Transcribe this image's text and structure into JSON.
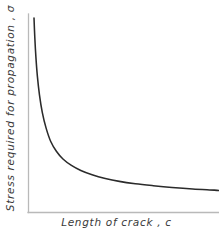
{
  "figure": {
    "background_color": "#ffffff",
    "axis_color": "#b9b9b9",
    "curve_color": "#2b2b2b",
    "text_color": "#3a3a3a"
  },
  "axes": {
    "x_label": "Length  of  crack , c",
    "y_label": "Stress  required  for  propagation , σ"
  },
  "chart_data": {
    "type": "line",
    "title": "",
    "xlabel": "Length  of  crack , c",
    "ylabel": "Stress  required  for  propagation , σ",
    "grid": false,
    "legend": null,
    "xlim": [
      0,
      1
    ],
    "ylim": [
      0,
      1
    ],
    "x_ticks": [],
    "y_ticks": [],
    "series": [
      {
        "name": "stress-vs-crack-length",
        "x": [
          0.016,
          0.02,
          0.026,
          0.034,
          0.045,
          0.06,
          0.08,
          0.105,
          0.135,
          0.17,
          0.215,
          0.265,
          0.325,
          0.395,
          0.47,
          0.555,
          0.65,
          0.75,
          0.86,
          0.975,
          1.0
        ],
        "y": [
          1.0,
          0.905,
          0.8,
          0.7,
          0.605,
          0.515,
          0.435,
          0.365,
          0.315,
          0.275,
          0.242,
          0.216,
          0.194,
          0.175,
          0.16,
          0.148,
          0.138,
          0.129,
          0.121,
          0.115,
          0.113
        ]
      }
    ]
  }
}
